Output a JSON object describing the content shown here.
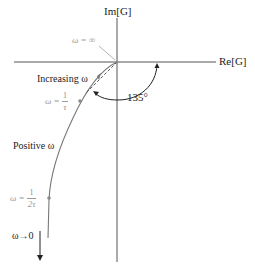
{
  "diagram": {
    "type": "nyquist-plot",
    "axes": {
      "imaginary_label": "Im[G]",
      "real_label": "Re[G]"
    },
    "annotations": {
      "omega_infinity": "ω = ∞",
      "increasing_omega": "Increasing ω",
      "omega_one_over_tau": {
        "prefix": "ω =",
        "numerator": "1",
        "denominator": "τ"
      },
      "angle": "135°",
      "positive_omega": "Positive ω",
      "omega_one_over_two_tau": {
        "prefix": "ω =",
        "numerator": "1",
        "denominator": "2τ"
      },
      "omega_to_zero": "ω→0"
    },
    "colors": {
      "axis": "#555555",
      "curve": "#777777",
      "dark_text": "#222222",
      "gray_text": "#9a9a9a",
      "marker": "#8a8a8a"
    }
  }
}
